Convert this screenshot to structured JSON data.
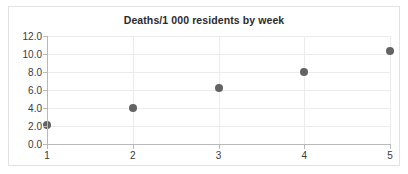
{
  "chart_data": {
    "type": "scatter",
    "title": "Deaths/1 000 residents by week",
    "xlabel": "",
    "ylabel": "",
    "x": [
      1,
      2,
      3,
      4,
      5
    ],
    "values": [
      2.1,
      4.0,
      6.2,
      8.0,
      10.3
    ],
    "series": [
      {
        "name": "Deaths per 1 000 residents",
        "values": [
          2.1,
          4.0,
          6.2,
          8.0,
          10.3
        ]
      }
    ],
    "xlim": [
      1,
      5
    ],
    "ylim": [
      0.0,
      12.0
    ],
    "xticks": [
      "1",
      "2",
      "3",
      "4",
      "5"
    ],
    "yticks": [
      "0.0",
      "2.0",
      "4.0",
      "6.0",
      "8.0",
      "10.0",
      "12.0"
    ],
    "ytick_values": [
      0.0,
      2.0,
      4.0,
      6.0,
      8.0,
      10.0,
      12.0
    ],
    "grid": true,
    "legend": false,
    "marker_color": "#636363",
    "grid_color": "#ececec",
    "axis_color": "#b9b9b9",
    "background_color": "#ffffff",
    "frame_color": "#e2e2e2",
    "text_color": "#3a3a3a",
    "title_color": "#2b2b2b"
  }
}
